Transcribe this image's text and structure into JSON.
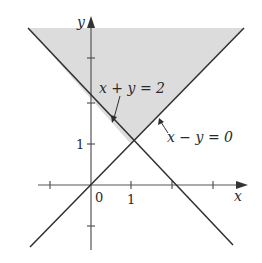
{
  "diagram": {
    "type": "inequality-region-plot",
    "axes": {
      "x_label": "x",
      "y_label": "y",
      "origin_label": "0",
      "x_tick_label": "1",
      "y_tick_label": "1",
      "x_ticks": [
        -1,
        0,
        1,
        2,
        3
      ],
      "y_ticks": [
        -1,
        1,
        2,
        3
      ]
    },
    "lines": [
      {
        "name": "x-plus-y-equals-2",
        "label": "x + y = 2"
      },
      {
        "name": "x-minus-y-equals-0",
        "label": "x − y = 0"
      }
    ],
    "shaded_region": {
      "description": "y >= 2 - x and y >= x",
      "color": "#dcdcdc"
    },
    "colors": {
      "line": "#2f2f2f",
      "axis": "#555555",
      "shade": "#dcdcdc"
    }
  }
}
